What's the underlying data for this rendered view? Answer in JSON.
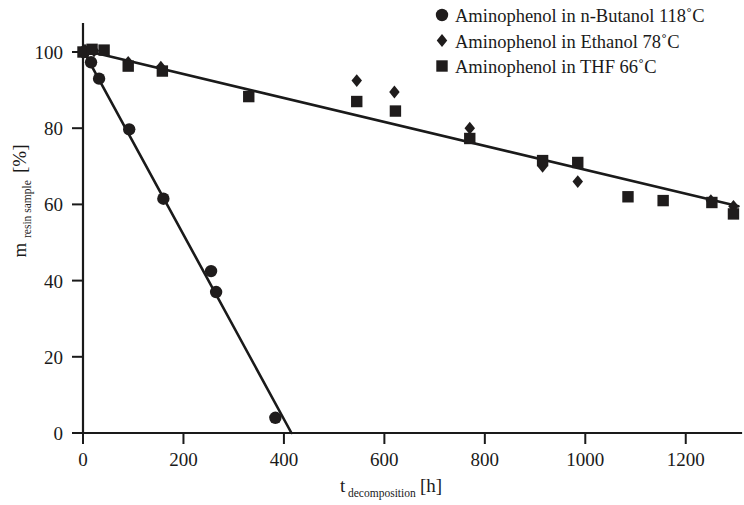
{
  "chart_data": {
    "type": "scatter",
    "title": "",
    "xlabel": "t_decomposition [h]",
    "xlabel_main": "t",
    "xlabel_sub": "decomposition",
    "xlabel_unit": "[h]",
    "ylabel": "m_resin sample [%]",
    "ylabel_main": "m",
    "ylabel_sub": "resin sample",
    "ylabel_unit": "[%]",
    "xlim": [
      0,
      1310
    ],
    "ylim": [
      0,
      107
    ],
    "xticks": [
      0,
      200,
      400,
      600,
      800,
      1000,
      1200
    ],
    "xtick_labels": [
      "0",
      "200",
      "400",
      "600",
      "800",
      "1000",
      "1200"
    ],
    "yticks": [
      0,
      20,
      40,
      60,
      80,
      100
    ],
    "ytick_labels": [
      "0",
      "20",
      "40",
      "60",
      "80",
      "100"
    ],
    "grid": false,
    "legend_position": "top-right",
    "series": [
      {
        "name": "Aminophenol in n-Butanol 118°C",
        "marker": "circle",
        "color": "#1f1c1c",
        "points": [
          {
            "x": 2,
            "y": 100.0
          },
          {
            "x": 16,
            "y": 97.3
          },
          {
            "x": 32,
            "y": 93.0
          },
          {
            "x": 92,
            "y": 79.7
          },
          {
            "x": 160,
            "y": 61.5
          },
          {
            "x": 255,
            "y": 42.5
          },
          {
            "x": 265,
            "y": 37.0
          },
          {
            "x": 383,
            "y": 4.0
          }
        ],
        "fit_line": {
          "x0": 0,
          "y0": 100.5,
          "x1": 415,
          "y1": 0
        }
      },
      {
        "name": "Aminophenol in Ethanol 78°C",
        "marker": "diamond",
        "color": "#1f1c1c",
        "points": [
          {
            "x": 4,
            "y": 100.5
          },
          {
            "x": 22,
            "y": 100.3
          },
          {
            "x": 90,
            "y": 97.3
          },
          {
            "x": 155,
            "y": 96.0
          },
          {
            "x": 545,
            "y": 92.5
          },
          {
            "x": 620,
            "y": 89.5
          },
          {
            "x": 770,
            "y": 80.0
          },
          {
            "x": 915,
            "y": 70.0
          },
          {
            "x": 985,
            "y": 66.0
          },
          {
            "x": 1250,
            "y": 61.0
          },
          {
            "x": 1295,
            "y": 59.5
          }
        ],
        "fit_line": null
      },
      {
        "name": "Aminophenol in THF 66°C",
        "marker": "square",
        "color": "#1f1c1c",
        "points": [
          {
            "x": 0,
            "y": 100.0
          },
          {
            "x": 18,
            "y": 100.7
          },
          {
            "x": 42,
            "y": 100.5
          },
          {
            "x": 90,
            "y": 96.3
          },
          {
            "x": 158,
            "y": 95.0
          },
          {
            "x": 330,
            "y": 88.3
          },
          {
            "x": 545,
            "y": 87.0
          },
          {
            "x": 622,
            "y": 84.5
          },
          {
            "x": 770,
            "y": 77.3
          },
          {
            "x": 915,
            "y": 71.5
          },
          {
            "x": 985,
            "y": 71.0
          },
          {
            "x": 1085,
            "y": 62.0
          },
          {
            "x": 1155,
            "y": 61.0
          },
          {
            "x": 1252,
            "y": 60.5
          },
          {
            "x": 1295,
            "y": 57.5
          }
        ],
        "fit_line": {
          "x0": 0,
          "y0": 100.5,
          "x1": 1305,
          "y1": 59.5
        }
      }
    ]
  },
  "legend": {
    "entries": [
      {
        "marker": "circle",
        "label": "Aminophenol in n-Butanol 118˚C"
      },
      {
        "marker": "diamond",
        "label": "Aminophenol in Ethanol 78˚C"
      },
      {
        "marker": "square",
        "label": "Aminophenol in THF 66˚C"
      }
    ]
  }
}
